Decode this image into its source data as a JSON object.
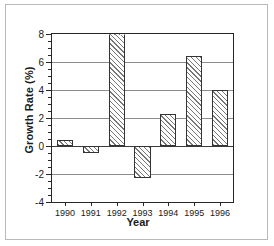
{
  "chart_data": {
    "type": "bar",
    "title": "",
    "xlabel": "Year",
    "ylabel": "Growth Rate (%)",
    "categories": [
      "1990",
      "1991",
      "1992",
      "1993",
      "1994",
      "1995",
      "1996"
    ],
    "values": [
      0.4,
      -0.5,
      8.0,
      -2.3,
      2.3,
      6.4,
      4.0
    ],
    "ylim": [
      -4,
      8
    ],
    "ytick_labels": [
      "8",
      "6",
      "4",
      "2",
      "0",
      "-2",
      "-4"
    ],
    "ytick_values": [
      8,
      6,
      4,
      2,
      0,
      -2,
      -4
    ],
    "yminor_step": 0.5,
    "grid": "horizontal",
    "legend": "none",
    "bar_fill": "diagonal-hatch",
    "bar_edge_color": "#333333",
    "grid_color": "#8c8c8c",
    "axis_color": "#262626"
  },
  "figure": {
    "background": "#ffffff",
    "border_color": "#b9b9b9"
  }
}
